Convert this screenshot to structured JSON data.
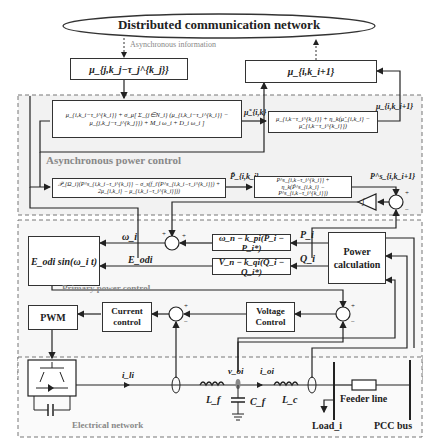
{
  "network": {
    "title": "Distributed communication network",
    "async_info_label": "Asynchronous information"
  },
  "comm_blocks": {
    "received": "μ_{j,k_j−τ_j^{k_j}}",
    "sent": "μ_{i,k_i+1}"
  },
  "async_power_control": {
    "label": "Asynchronous power control",
    "mu_update_block": "μ_{i,k_i−τ_i^{k_i}} + σ_μ[ Σ_{j∈N_i} (μ_{i,k_i−τ_i^{k_i}} − μ_{j,k_j−τ_j^{k_j}}) + M_i ω_i + D_i ω_i ]",
    "mu_tilde_signal": "μ̃_{i,k}",
    "mu_avg_block": "μ_{i,k−τ_i^{k_i}} + η_k(μ̃_{i,k_i} − μ̃_{i,k−τ_i^{k_i}})",
    "mu_out_signal": "μ_{i,k_i+1}",
    "p_projection_block": "𝒫_{Ω_i}(P^s_{i,k_i−τ_i^{k_i}} − σ_s(f_i′(P^s_{i,k_i−τ_i^{k_i}}) + 2μ_{i,k_i} − μ_{i,k_i−τ_i^{k_i}}))",
    "p_tilde_signal": "P̃_{i,k_i}",
    "p_avg_block": "P^s_{i,k−τ_i^{k_i}} + η_k(P̃^s_{i,k_i} − P^s_{i,k−τ_i^{k_i}})",
    "p_out_signal": "P^s_{i,k_i+1}",
    "integrator_icon": "integrator-triangle",
    "sum_signs": [
      "+",
      "−"
    ]
  },
  "primary_power_control": {
    "label": "Primary power control",
    "sine_block": "E_odi sin(ω_i t)",
    "freq_droop_block": "ω_n − k_pi(P_i − P_i*)",
    "volt_droop_block": "V_n − k_qi(Q_i − Q_i*)",
    "power_calc_block": [
      "Power",
      "calculation"
    ],
    "signals": {
      "omega": "ω_i",
      "e_odi": "E_odi",
      "p": "P_i",
      "q": "Q_i"
    },
    "sum_signs": [
      "+",
      "+"
    ]
  },
  "inner_control": {
    "pwm": "PWM",
    "current_control": [
      "Current",
      "control"
    ],
    "voltage_control": [
      "Voltage",
      "Control"
    ],
    "sum_signs_current": [
      "+",
      "−"
    ],
    "sum_signs_voltage": [
      "+",
      "−"
    ]
  },
  "electrical_network": {
    "label": "Electrical network",
    "signals": {
      "i_li": "i_li",
      "v_oi": "v_oi",
      "i_oi": "i_oi"
    },
    "components": {
      "lf": "L_f",
      "cf": "C_f",
      "lc": "L_c",
      "feeder": "Feeder line",
      "load": "Load_i",
      "pcc": "PCC bus"
    }
  }
}
